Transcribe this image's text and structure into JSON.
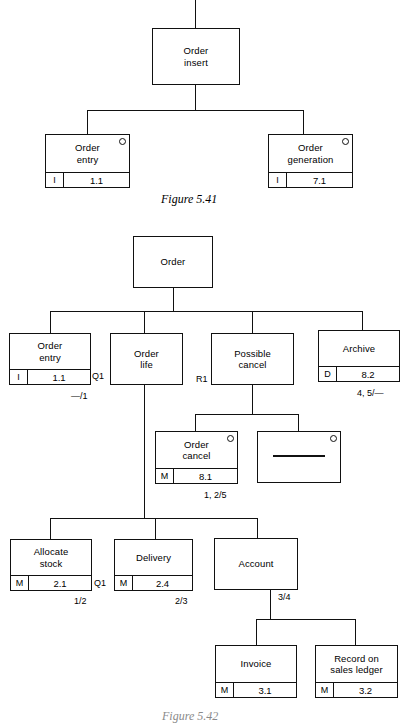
{
  "page": {
    "background": "#ffffff",
    "ink": "#111111"
  },
  "figures": [
    {
      "id": "figure-5-41",
      "caption": "Figure 5.41",
      "boxes": [
        {
          "id": "order-insert",
          "title": "Order\ninsert",
          "code": "",
          "num": "",
          "marker": false,
          "footer": false,
          "dash": false
        },
        {
          "id": "order-entry",
          "title": "Order\nentry",
          "code": "I",
          "num": "1.1",
          "marker": true,
          "footer": true,
          "dash": false
        },
        {
          "id": "order-generation",
          "title": "Order\ngeneration",
          "code": "I",
          "num": "7.1",
          "marker": true,
          "footer": true,
          "dash": false
        }
      ],
      "labels": []
    },
    {
      "id": "figure-5-42",
      "caption": "Figure 5.42",
      "boxes": [
        {
          "id": "order",
          "title": "Order",
          "code": "",
          "num": "",
          "marker": false,
          "footer": false,
          "dash": false
        },
        {
          "id": "order-entry-2",
          "title": "Order\nentry",
          "code": "I",
          "num": "1.1",
          "marker": false,
          "footer": true,
          "dash": false
        },
        {
          "id": "order-life",
          "title": "Order\nlife",
          "code": "",
          "num": "",
          "marker": false,
          "footer": false,
          "dash": false
        },
        {
          "id": "possible-cancel",
          "title": "Possible\ncancel",
          "code": "",
          "num": "",
          "marker": false,
          "footer": false,
          "dash": false
        },
        {
          "id": "archive",
          "title": "Archive",
          "code": "D",
          "num": "8.2",
          "marker": false,
          "footer": true,
          "dash": false
        },
        {
          "id": "order-cancel",
          "title": "Order\ncancel",
          "code": "M",
          "num": "8.1",
          "marker": true,
          "footer": true,
          "dash": false
        },
        {
          "id": "blank-module",
          "title": "",
          "code": "",
          "num": "",
          "marker": true,
          "footer": false,
          "dash": true
        },
        {
          "id": "allocate-stock",
          "title": "Allocate\nstock",
          "code": "M",
          "num": "2.1",
          "marker": false,
          "footer": true,
          "dash": false
        },
        {
          "id": "delivery",
          "title": "Delivery",
          "code": "M",
          "num": "2.4",
          "marker": false,
          "footer": true,
          "dash": false
        },
        {
          "id": "account",
          "title": "Account",
          "code": "",
          "num": "",
          "marker": false,
          "footer": false,
          "dash": false
        },
        {
          "id": "invoice",
          "title": "Invoice",
          "code": "M",
          "num": "3.1",
          "marker": false,
          "footer": true,
          "dash": false
        },
        {
          "id": "record-on-sales-ledger",
          "title": "Record on\nsales ledger",
          "code": "M",
          "num": "3.2",
          "marker": false,
          "footer": true,
          "dash": false
        }
      ],
      "labels": [
        {
          "id": "q1-order-entry",
          "text": "Q1"
        },
        {
          "id": "ratio-order-entry",
          "text": "—/1"
        },
        {
          "id": "r1-order-life",
          "text": "R1"
        },
        {
          "id": "ratio-archive",
          "text": "4, 5/—"
        },
        {
          "id": "ratio-order-cancel",
          "text": "1, 2/5"
        },
        {
          "id": "q1-allocate-stock",
          "text": "Q1"
        },
        {
          "id": "ratio-allocate",
          "text": "1/2"
        },
        {
          "id": "ratio-delivery",
          "text": "2/3"
        },
        {
          "id": "ratio-account",
          "text": "3/4"
        }
      ]
    }
  ]
}
